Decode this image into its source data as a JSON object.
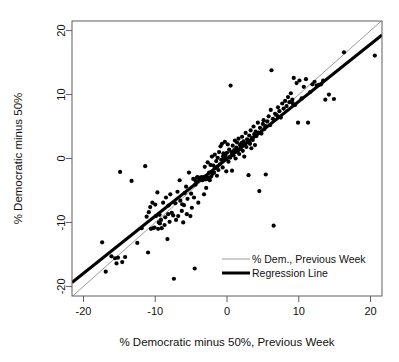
{
  "figure": {
    "title": "",
    "background_color": "#ffffff",
    "foreground_color": "#111111"
  },
  "axis": {
    "x_title": "% Democratic minus 50%, Previous Week",
    "y_title": "% Democratic minus 50%",
    "x_ticks": [
      "-20",
      "-10",
      "0",
      "10",
      "20"
    ],
    "y_ticks": [
      "-20",
      "-10",
      "0",
      "10",
      "20"
    ]
  },
  "legend": {
    "position": "bottom-right",
    "entries": [
      {
        "label": "% Dem., Previous Week",
        "style": "thin-line",
        "color": "#9a9a9a",
        "width": 1
      },
      {
        "label": "Regression Line",
        "style": "thick-line",
        "color": "#000000",
        "width": 3
      }
    ]
  },
  "chart_data": {
    "type": "scatter",
    "title": "",
    "xlabel": "% Democratic minus 50%, Previous Week",
    "ylabel": "% Democratic minus 50%",
    "xlim": [
      -21.6,
      21.6
    ],
    "ylim": [
      -21.5,
      21.5
    ],
    "xticks": [
      -20,
      -10,
      0,
      10,
      20
    ],
    "yticks": [
      -20,
      -10,
      0,
      10,
      20
    ],
    "grid": false,
    "legend_position": "lower right",
    "point_color": "#000000",
    "point_radius_px": 2.1,
    "series": [
      {
        "name": "Poll observations",
        "type": "scatter",
        "points": [
          [
            -17.4,
            -13.1
          ],
          [
            -16.9,
            -17.7
          ],
          [
            -16.1,
            -15.3
          ],
          [
            -15.6,
            -15.6
          ],
          [
            -15.4,
            -16.4
          ],
          [
            -15.2,
            -15.5
          ],
          [
            -14.9,
            -2.1
          ],
          [
            -14.6,
            -16.2
          ],
          [
            -14.2,
            -15.4
          ],
          [
            -13.3,
            -3.5
          ],
          [
            -12.5,
            -13.2
          ],
          [
            -11.9,
            -10.9
          ],
          [
            -11.4,
            -1.2
          ],
          [
            -11.2,
            -9.1
          ],
          [
            -11.0,
            -14.7
          ],
          [
            -10.9,
            -8.4
          ],
          [
            -10.7,
            -7.6
          ],
          [
            -10.6,
            -11.0
          ],
          [
            -10.4,
            -6.9
          ],
          [
            -10.3,
            -10.9
          ],
          [
            -10.1,
            -10.8
          ],
          [
            -10.0,
            -7.2
          ],
          [
            -9.9,
            -9.0
          ],
          [
            -9.7,
            -5.3
          ],
          [
            -9.6,
            -11.0
          ],
          [
            -9.5,
            -10.0
          ],
          [
            -9.4,
            -8.8
          ],
          [
            -9.2,
            -9.6
          ],
          [
            -9.1,
            -10.9
          ],
          [
            -8.9,
            -6.9
          ],
          [
            -8.7,
            -10.4
          ],
          [
            -8.6,
            -9.2
          ],
          [
            -8.5,
            -6.1
          ],
          [
            -8.3,
            -12.6
          ],
          [
            -8.2,
            -8.7
          ],
          [
            -8.0,
            -9.9
          ],
          [
            -7.9,
            -5.6
          ],
          [
            -7.7,
            -8.5
          ],
          [
            -7.5,
            -8.9
          ],
          [
            -7.4,
            -18.8
          ],
          [
            -7.2,
            -7.0
          ],
          [
            -7.1,
            -9.6
          ],
          [
            -6.9,
            -5.2
          ],
          [
            -6.8,
            -9.0
          ],
          [
            -6.6,
            -3.4
          ],
          [
            -6.5,
            -6.6
          ],
          [
            -6.3,
            -8.2
          ],
          [
            -6.1,
            -10.0
          ],
          [
            -6.0,
            -7.3
          ],
          [
            -5.9,
            -5.4
          ],
          [
            -5.7,
            -4.4
          ],
          [
            -5.6,
            -8.7
          ],
          [
            -5.5,
            -6.3
          ],
          [
            -5.3,
            -2.2
          ],
          [
            -5.1,
            -9.0
          ],
          [
            -5.0,
            -5.5
          ],
          [
            -4.9,
            -7.7
          ],
          [
            -4.7,
            -3.2
          ],
          [
            -4.6,
            -6.1
          ],
          [
            -4.5,
            -17.2
          ],
          [
            -4.4,
            -4.1
          ],
          [
            -4.2,
            -3.0
          ],
          [
            -4.1,
            -2.9
          ],
          [
            -4.0,
            -6.9
          ],
          [
            -3.9,
            -3.1
          ],
          [
            -3.8,
            -3.3
          ],
          [
            -3.7,
            -3.0
          ],
          [
            -3.6,
            -3.2
          ],
          [
            -3.5,
            -2.9
          ],
          [
            -3.4,
            -3.4
          ],
          [
            -3.3,
            -3.1
          ],
          [
            -3.2,
            -5.6
          ],
          [
            -3.1,
            -1.3
          ],
          [
            -3.0,
            -3.0
          ],
          [
            -2.9,
            -4.6
          ],
          [
            -2.8,
            -3.2
          ],
          [
            -2.7,
            -0.6
          ],
          [
            -2.6,
            -3.0
          ],
          [
            -2.5,
            -2.2
          ],
          [
            -2.4,
            -3.4
          ],
          [
            -2.3,
            -1.0
          ],
          [
            -2.2,
            -2.8
          ],
          [
            -2.1,
            0.3
          ],
          [
            -2.0,
            -2.4
          ],
          [
            -1.9,
            -1.1
          ],
          [
            -1.8,
            -2.2
          ],
          [
            -1.7,
            0.6
          ],
          [
            -1.6,
            -1.5
          ],
          [
            -1.5,
            -0.4
          ],
          [
            -1.4,
            -2.7
          ],
          [
            -1.3,
            0.1
          ],
          [
            -1.2,
            -1.8
          ],
          [
            -1.1,
            1.0
          ],
          [
            -1.0,
            -0.9
          ],
          [
            -0.9,
            1.9
          ],
          [
            -0.8,
            -0.2
          ],
          [
            -0.7,
            2.3
          ],
          [
            -0.6,
            -1.4
          ],
          [
            -0.5,
            0.8
          ],
          [
            -0.4,
            -0.1
          ],
          [
            -0.3,
            2.6
          ],
          [
            -0.2,
            0.4
          ],
          [
            -0.1,
            -2.0
          ],
          [
            0.0,
            0.9
          ],
          [
            0.1,
            2.2
          ],
          [
            0.2,
            -0.5
          ],
          [
            0.3,
            1.4
          ],
          [
            0.4,
            0.2
          ],
          [
            0.5,
            11.4
          ],
          [
            0.6,
            1.0
          ],
          [
            0.7,
            -1.9
          ],
          [
            0.8,
            2.0
          ],
          [
            0.9,
            0.5
          ],
          [
            1.0,
            1.3
          ],
          [
            1.1,
            2.8
          ],
          [
            1.2,
            0.0
          ],
          [
            1.3,
            1.7
          ],
          [
            1.4,
            2.5
          ],
          [
            1.5,
            1.1
          ],
          [
            1.6,
            3.1
          ],
          [
            1.7,
            0.7
          ],
          [
            1.8,
            2.1
          ],
          [
            1.9,
            1.5
          ],
          [
            2.0,
            2.4
          ],
          [
            2.1,
            3.4
          ],
          [
            2.2,
            1.2
          ],
          [
            2.3,
            2.7
          ],
          [
            2.4,
            0.3
          ],
          [
            2.5,
            2.2
          ],
          [
            2.6,
            4.0
          ],
          [
            2.7,
            1.8
          ],
          [
            2.8,
            3.0
          ],
          [
            2.9,
            2.6
          ],
          [
            3.0,
            -2.6
          ],
          [
            3.1,
            3.6
          ],
          [
            3.2,
            2.3
          ],
          [
            3.3,
            4.4
          ],
          [
            3.4,
            1.6
          ],
          [
            3.5,
            3.2
          ],
          [
            3.6,
            2.9
          ],
          [
            3.7,
            5.0
          ],
          [
            3.8,
            3.8
          ],
          [
            3.9,
            2.1
          ],
          [
            4.0,
            4.2
          ],
          [
            4.1,
            3.5
          ],
          [
            4.3,
            5.6
          ],
          [
            4.4,
            4.0
          ],
          [
            4.5,
            -5.1
          ],
          [
            4.6,
            4.8
          ],
          [
            4.8,
            3.9
          ],
          [
            5.0,
            5.4
          ],
          [
            5.1,
            6.0
          ],
          [
            5.2,
            4.6
          ],
          [
            5.4,
            -2.5
          ],
          [
            5.6,
            5.8
          ],
          [
            5.8,
            6.6
          ],
          [
            6.0,
            5.2
          ],
          [
            6.1,
            7.6
          ],
          [
            6.2,
            13.8
          ],
          [
            6.4,
            6.2
          ],
          [
            6.5,
            -10.5
          ],
          [
            6.7,
            7.0
          ],
          [
            6.9,
            6.8
          ],
          [
            7.1,
            8.0
          ],
          [
            7.3,
            7.4
          ],
          [
            7.5,
            6.4
          ],
          [
            7.7,
            8.6
          ],
          [
            7.9,
            7.8
          ],
          [
            8.1,
            9.0
          ],
          [
            8.3,
            8.2
          ],
          [
            8.5,
            9.6
          ],
          [
            8.7,
            8.8
          ],
          [
            8.9,
            10.2
          ],
          [
            9.1,
            9.2
          ],
          [
            9.3,
            12.6
          ],
          [
            9.5,
            8.4
          ],
          [
            9.7,
            11.8
          ],
          [
            9.9,
            5.6
          ],
          [
            10.1,
            12.2
          ],
          [
            10.4,
            9.4
          ],
          [
            10.7,
            11.2
          ],
          [
            11.0,
            12.4
          ],
          [
            11.3,
            5.6
          ],
          [
            11.6,
            10.4
          ],
          [
            11.9,
            11.6
          ],
          [
            12.2,
            12.0
          ],
          [
            12.5,
            11.4
          ],
          [
            12.8,
            11.5
          ],
          [
            13.1,
            11.6
          ],
          [
            13.4,
            12.2
          ],
          [
            13.7,
            9.2
          ],
          [
            14.2,
            10.0
          ],
          [
            14.9,
            9.3
          ],
          [
            16.3,
            16.6
          ],
          [
            20.6,
            16.1
          ],
          [
            -2.95,
            -3.25
          ],
          [
            -3.15,
            -2.85
          ],
          [
            -2.45,
            -3.15
          ],
          [
            -1.35,
            -1.25
          ],
          [
            0.45,
            0.15
          ],
          [
            1.25,
            1.05
          ],
          [
            2.15,
            1.95
          ],
          [
            -4.35,
            -3.55
          ],
          [
            3.15,
            2.45
          ],
          [
            5.35,
            5.05
          ],
          [
            -0.55,
            0.35
          ],
          [
            -6.25,
            -7.15
          ],
          [
            -8.15,
            -7.35
          ],
          [
            -9.35,
            -10.15
          ],
          [
            7.15,
            6.55
          ],
          [
            9.15,
            8.65
          ]
        ]
      }
    ],
    "lines": [
      {
        "name": "% Dem., Previous Week",
        "description": "identity reference line y = x",
        "style": "thin",
        "color": "#9a9a9a",
        "width": 1,
        "slope": 1.0,
        "intercept": 0.0,
        "x_range": [
          -21.6,
          21.6
        ]
      },
      {
        "name": "Regression Line",
        "description": "ordinary least squares fit",
        "style": "thick",
        "color": "#000000",
        "width": 3,
        "slope": 0.896,
        "intercept": -0.04,
        "x_range": [
          -21.6,
          21.6
        ]
      }
    ]
  }
}
